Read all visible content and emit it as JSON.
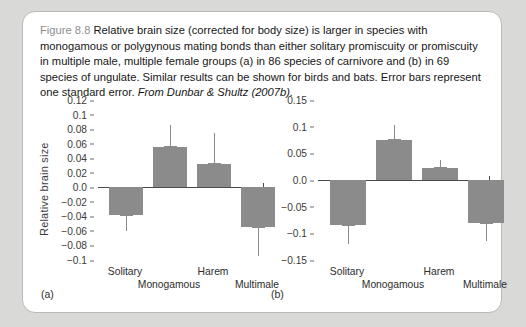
{
  "caption": {
    "figure_number": "Figure 8.8",
    "text": "Relative brain size (corrected for body size) is larger in species with monogamous or polygynous mating bonds than either solitary promiscuity or promiscuity in multiple male, multiple female groups (a) in 86 species of carnivore and (b) in 69 species of ungulate. Similar results can be shown for birds and bats. Error bars represent one standard error.",
    "source": "From Dunbar & Shultz (2007b)."
  },
  "chart_data": [
    {
      "type": "bar",
      "panel": "(a)",
      "title": "",
      "xlabel": "",
      "ylabel": "Relative brain size",
      "categories": [
        "Solitary",
        "Monogamous",
        "Harem",
        "Multimale"
      ],
      "values": [
        -0.038,
        0.055,
        0.032,
        -0.055
      ],
      "errors": [
        0.022,
        0.03,
        0.043,
        0.04
      ],
      "ylim": [
        -0.1,
        0.12
      ],
      "yticks": [
        0.12,
        0.1,
        0.08,
        0.06,
        0.04,
        0.02,
        0.0,
        -0.02,
        -0.04,
        -0.06,
        -0.08,
        -0.1
      ],
      "yticklabels": [
        "0.12",
        "0.1",
        "0.08",
        "0.06",
        "0.04",
        "0.02",
        "0.0",
        "−0.02",
        "−0.04",
        "−0.06",
        "−0.08",
        "−0.1"
      ],
      "grid": false,
      "legend": "none",
      "n_species": 86,
      "taxon": "carnivore"
    },
    {
      "type": "bar",
      "panel": "(b)",
      "title": "",
      "xlabel": "",
      "ylabel": "",
      "categories": [
        "Solitary",
        "Monogamous",
        "Harem",
        "Multimale"
      ],
      "values": [
        -0.085,
        0.075,
        0.022,
        -0.08
      ],
      "errors": [
        0.035,
        0.028,
        0.016,
        0.035
      ],
      "ylim": [
        -0.15,
        0.15
      ],
      "yticks": [
        0.15,
        0.1,
        0.05,
        0.0,
        -0.05,
        -0.1,
        -0.15
      ],
      "yticklabels": [
        "0.15",
        "0.1",
        "0.05",
        "0.0",
        "−0.05",
        "−0.1",
        "−0.15"
      ],
      "grid": false,
      "legend": "none",
      "n_species": 69,
      "taxon": "ungulate"
    }
  ],
  "style": {
    "bar_color": "#8b8b8b",
    "axis_color": "#4a4a4a",
    "card_background": "#ffffff",
    "page_background": "#d9d9d7"
  }
}
